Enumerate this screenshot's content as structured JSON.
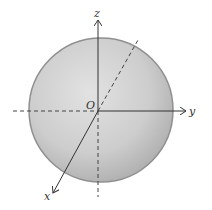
{
  "diagram": {
    "type": "3d-coordinate-sphere",
    "labels": {
      "origin": "O",
      "x_axis": "x",
      "y_axis": "y",
      "z_axis": "z"
    },
    "colors": {
      "sphere_light": "#dcdcdc",
      "sphere_dark": "#a8a8a8",
      "sphere_edge": "#8a8a8a",
      "axis": "#333333"
    }
  }
}
